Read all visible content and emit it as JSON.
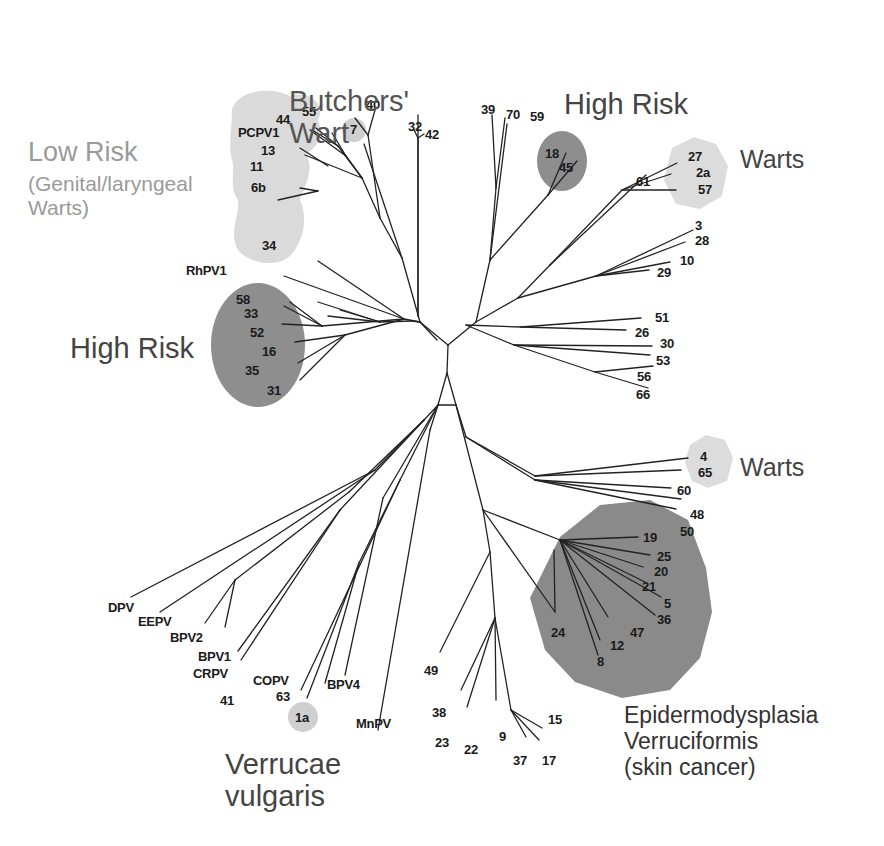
{
  "figure": {
    "type": "unrooted phylogenetic tree",
    "colors": {
      "background": "#ffffff",
      "branch": "#222222",
      "leaf_text": "#1a1a1a",
      "high_risk_fill": "#8e8e8e",
      "epidermodysplasia_fill": "#8a8a8a",
      "low_risk_fill": "#d9d9d9",
      "warts_fill": "#dcdcdc",
      "low_risk_label": "#a3a3a3",
      "dark_label": "#333333"
    }
  },
  "groups": [
    {
      "id": "butchers-wart",
      "label": "Butchers'\nWart",
      "x": 289,
      "y": 85,
      "size": 29,
      "color": "#555555"
    },
    {
      "id": "low-risk",
      "label": "Low Risk",
      "x": 28,
      "y": 137,
      "size": 27,
      "color": "#9a9a9a"
    },
    {
      "id": "low-risk-sub",
      "label": "(Genital/laryngeal\nWarts)",
      "x": 28,
      "y": 172,
      "size": 21,
      "color": "#9a9a9a"
    },
    {
      "id": "high-risk-left",
      "label": "High Risk",
      "x": 70,
      "y": 332,
      "size": 29,
      "color": "#444444"
    },
    {
      "id": "high-risk-top",
      "label": "High Risk",
      "x": 564,
      "y": 88,
      "size": 29,
      "color": "#444444"
    },
    {
      "id": "warts-top",
      "label": "Warts",
      "x": 740,
      "y": 145,
      "size": 25,
      "color": "#444444"
    },
    {
      "id": "warts-mid",
      "label": "Warts",
      "x": 740,
      "y": 453,
      "size": 25,
      "color": "#444444"
    },
    {
      "id": "verrucae-vulgaris",
      "label": "Verrucae\nvulgaris",
      "x": 225,
      "y": 748,
      "size": 29,
      "color": "#444444"
    },
    {
      "id": "epidermodysplasia",
      "label": "Epidermodysplasia\nVerruciformis\n(skin cancer)",
      "x": 624,
      "y": 703,
      "size": 23,
      "color": "#333333"
    }
  ],
  "regions": [
    {
      "id": "low-risk-blob",
      "shape": "path",
      "fill": "#dadada",
      "d": "M232,110 C236,92 268,85 290,96 C310,90 326,104 318,120 C324,134 318,148 306,154 C316,172 302,190 300,200 C310,222 300,246 290,256 C276,268 250,264 238,250 C228,232 240,216 238,200 C228,186 236,170 232,160 C228,146 232,126 232,110 Z"
    },
    {
      "id": "butchers-dot",
      "shape": "circle",
      "fill": "#cfcfcf",
      "cx": 354,
      "cy": 130,
      "r": 12
    },
    {
      "id": "high-risk-left-ellipse",
      "shape": "ellipse",
      "fill": "#8e8e8e",
      "cx": 258,
      "cy": 345,
      "rx": 47,
      "ry": 62
    },
    {
      "id": "high-risk-top-ellipse",
      "shape": "ellipse",
      "fill": "#8e8e8e",
      "cx": 562,
      "cy": 161,
      "rx": 25,
      "ry": 30
    },
    {
      "id": "warts-top-hex",
      "shape": "polygon",
      "fill": "#dcdcdc",
      "points": "672,148 694,137 716,144 728,166 722,196 700,209 676,204 664,180"
    },
    {
      "id": "warts-mid-hex",
      "shape": "polygon",
      "fill": "#dcdcdc",
      "points": "690,445 706,435 725,440 733,458 727,481 708,488 692,481 685,462"
    },
    {
      "id": "ev-polygon",
      "shape": "polygon",
      "fill": "#8a8a8a",
      "points": "560,537 600,505 650,500 688,520 706,568 712,612 700,658 670,690 622,698 575,682 545,650 530,598"
    },
    {
      "id": "verrucae-dot",
      "shape": "circle",
      "fill": "#cfcfcf",
      "cx": 303,
      "cy": 717,
      "r": 15
    }
  ],
  "branches": [
    [
      447,
      373,
      448,
      345
    ],
    [
      448,
      345,
      420,
      322
    ],
    [
      448,
      345,
      476,
      322
    ],
    [
      447,
      373,
      438,
      405
    ],
    [
      438,
      405,
      456,
      405
    ],
    [
      447,
      373,
      456,
      405
    ],
    [
      420,
      322,
      404,
      319
    ],
    [
      420,
      322,
      402,
      258
    ],
    [
      420,
      322,
      412,
      321
    ],
    [
      404,
      319,
      318,
      261
    ],
    [
      404,
      319,
      284,
      276
    ],
    [
      402,
      258,
      364,
      144
    ],
    [
      402,
      258,
      380,
      218
    ],
    [
      380,
      218,
      368,
      135
    ],
    [
      368,
      135,
      355,
      118
    ],
    [
      368,
      135,
      375,
      110
    ],
    [
      380,
      218,
      362,
      178
    ],
    [
      362,
      178,
      338,
      146
    ],
    [
      362,
      178,
      346,
      156
    ],
    [
      346,
      156,
      310,
      130
    ],
    [
      346,
      156,
      332,
      133
    ],
    [
      338,
      146,
      316,
      128
    ],
    [
      338,
      146,
      312,
      130
    ],
    [
      362,
      178,
      305,
      155
    ],
    [
      328,
      166,
      300,
      148
    ],
    [
      318,
      191,
      278,
      200
    ],
    [
      318,
      191,
      300,
      188
    ],
    [
      412,
      321,
      380,
      322
    ],
    [
      380,
      322,
      340,
      310
    ],
    [
      380,
      322,
      318,
      302
    ],
    [
      380,
      322,
      328,
      316
    ],
    [
      404,
      319,
      322,
      326
    ],
    [
      322,
      326,
      290,
      302
    ],
    [
      322,
      326,
      284,
      306
    ],
    [
      322,
      326,
      282,
      324
    ],
    [
      404,
      319,
      345,
      335
    ],
    [
      345,
      335,
      295,
      342
    ],
    [
      345,
      335,
      298,
      363
    ],
    [
      345,
      335,
      300,
      380
    ],
    [
      418,
      316,
      418,
      115
    ],
    [
      418,
      316,
      418,
      138
    ],
    [
      418,
      138,
      414,
      130
    ],
    [
      418,
      138,
      424,
      134
    ],
    [
      420,
      322,
      437,
      340
    ],
    [
      476,
      322,
      490,
      260
    ],
    [
      490,
      260,
      496,
      188
    ],
    [
      496,
      188,
      492,
      115
    ],
    [
      496,
      188,
      505,
      118
    ],
    [
      490,
      260,
      507,
      124
    ],
    [
      490,
      260,
      548,
      195
    ],
    [
      548,
      195,
      566,
      153
    ],
    [
      548,
      195,
      577,
      161
    ],
    [
      476,
      322,
      518,
      298
    ],
    [
      518,
      298,
      550,
      265
    ],
    [
      550,
      265,
      646,
      175
    ],
    [
      550,
      265,
      622,
      190
    ],
    [
      622,
      190,
      677,
      163
    ],
    [
      622,
      190,
      671,
      174
    ],
    [
      622,
      190,
      676,
      190
    ],
    [
      518,
      298,
      596,
      276
    ],
    [
      596,
      276,
      693,
      230
    ],
    [
      596,
      276,
      685,
      242
    ],
    [
      596,
      276,
      670,
      262
    ],
    [
      596,
      276,
      649,
      270
    ],
    [
      466,
      325,
      521,
      327
    ],
    [
      521,
      327,
      641,
      318
    ],
    [
      521,
      327,
      626,
      330
    ],
    [
      466,
      325,
      514,
      345
    ],
    [
      514,
      345,
      652,
      346
    ],
    [
      514,
      345,
      650,
      355
    ],
    [
      514,
      345,
      595,
      372
    ],
    [
      595,
      372,
      653,
      366
    ],
    [
      595,
      372,
      648,
      388
    ],
    [
      456,
      405,
      466,
      437
    ],
    [
      466,
      437,
      535,
      476
    ],
    [
      535,
      476,
      688,
      458
    ],
    [
      535,
      476,
      681,
      470
    ],
    [
      466,
      437,
      535,
      480
    ],
    [
      535,
      480,
      671,
      488
    ],
    [
      535,
      480,
      681,
      499
    ],
    [
      535,
      480,
      676,
      509
    ],
    [
      456,
      405,
      483,
      510
    ],
    [
      483,
      510,
      560,
      540
    ],
    [
      560,
      540,
      638,
      537
    ],
    [
      560,
      540,
      650,
      555
    ],
    [
      560,
      540,
      643,
      567
    ],
    [
      560,
      540,
      645,
      582
    ],
    [
      560,
      540,
      661,
      597
    ],
    [
      560,
      540,
      655,
      615
    ],
    [
      483,
      510,
      555,
      612
    ],
    [
      555,
      612,
      554,
      550
    ],
    [
      560,
      540,
      608,
      617
    ],
    [
      560,
      540,
      600,
      640
    ],
    [
      560,
      540,
      598,
      655
    ],
    [
      483,
      510,
      490,
      552
    ],
    [
      490,
      552,
      440,
      652
    ],
    [
      490,
      552,
      495,
      618
    ],
    [
      495,
      618,
      461,
      690
    ],
    [
      495,
      618,
      467,
      707
    ],
    [
      495,
      618,
      496,
      700
    ],
    [
      495,
      618,
      511,
      710
    ],
    [
      511,
      710,
      526,
      737
    ],
    [
      511,
      710,
      542,
      728
    ],
    [
      511,
      710,
      539,
      740
    ],
    [
      438,
      405,
      424,
      420
    ],
    [
      424,
      420,
      375,
      470
    ],
    [
      375,
      470,
      131,
      597
    ],
    [
      375,
      470,
      160,
      612
    ],
    [
      424,
      420,
      349,
      492
    ],
    [
      349,
      492,
      235,
      580
    ],
    [
      235,
      580,
      205,
      623
    ],
    [
      235,
      580,
      225,
      627
    ],
    [
      424,
      420,
      340,
      510
    ],
    [
      340,
      510,
      238,
      651
    ],
    [
      340,
      510,
      241,
      660
    ],
    [
      438,
      405,
      400,
      480
    ],
    [
      400,
      480,
      301,
      690
    ],
    [
      400,
      480,
      359,
      563
    ],
    [
      359,
      563,
      325,
      683
    ],
    [
      359,
      563,
      307,
      698
    ],
    [
      438,
      405,
      383,
      498
    ],
    [
      383,
      498,
      345,
      675
    ],
    [
      438,
      405,
      430,
      430
    ],
    [
      430,
      430,
      378,
      730
    ]
  ],
  "leaves": [
    {
      "label": "40",
      "x": 366,
      "y": 98
    },
    {
      "label": "7",
      "x": 350,
      "y": 123
    },
    {
      "label": "32",
      "x": 408,
      "y": 120
    },
    {
      "label": "42",
      "x": 425,
      "y": 128
    },
    {
      "label": "44",
      "x": 276,
      "y": 113
    },
    {
      "label": "55",
      "x": 302,
      "y": 105
    },
    {
      "label": "PCPV1",
      "x": 238,
      "y": 126
    },
    {
      "label": "13",
      "x": 261,
      "y": 144
    },
    {
      "label": "11",
      "x": 250,
      "y": 160
    },
    {
      "label": "6b",
      "x": 251,
      "y": 181
    },
    {
      "label": "34",
      "x": 262,
      "y": 239
    },
    {
      "label": "RhPV1",
      "x": 186,
      "y": 264
    },
    {
      "label": "58",
      "x": 236,
      "y": 293
    },
    {
      "label": "33",
      "x": 244,
      "y": 307
    },
    {
      "label": "52",
      "x": 250,
      "y": 326
    },
    {
      "label": "16",
      "x": 262,
      "y": 345
    },
    {
      "label": "35",
      "x": 245,
      "y": 364
    },
    {
      "label": "31",
      "x": 267,
      "y": 384
    },
    {
      "label": "39",
      "x": 481,
      "y": 103
    },
    {
      "label": "70",
      "x": 506,
      "y": 108
    },
    {
      "label": "59",
      "x": 530,
      "y": 110
    },
    {
      "label": "18",
      "x": 545,
      "y": 147
    },
    {
      "label": "45",
      "x": 559,
      "y": 161
    },
    {
      "label": "61",
      "x": 636,
      "y": 175
    },
    {
      "label": "27",
      "x": 688,
      "y": 150
    },
    {
      "label": "2a",
      "x": 696,
      "y": 166
    },
    {
      "label": "57",
      "x": 698,
      "y": 183
    },
    {
      "label": "3",
      "x": 695,
      "y": 219
    },
    {
      "label": "28",
      "x": 695,
      "y": 234
    },
    {
      "label": "10",
      "x": 680,
      "y": 254
    },
    {
      "label": "29",
      "x": 657,
      "y": 266
    },
    {
      "label": "51",
      "x": 655,
      "y": 311
    },
    {
      "label": "26",
      "x": 635,
      "y": 326
    },
    {
      "label": "30",
      "x": 660,
      "y": 337
    },
    {
      "label": "53",
      "x": 656,
      "y": 354
    },
    {
      "label": "56",
      "x": 637,
      "y": 370
    },
    {
      "label": "66",
      "x": 636,
      "y": 388
    },
    {
      "label": "4",
      "x": 700,
      "y": 450
    },
    {
      "label": "65",
      "x": 698,
      "y": 466
    },
    {
      "label": "60",
      "x": 677,
      "y": 484
    },
    {
      "label": "48",
      "x": 690,
      "y": 508
    },
    {
      "label": "50",
      "x": 680,
      "y": 525
    },
    {
      "label": "19",
      "x": 643,
      "y": 531
    },
    {
      "label": "25",
      "x": 657,
      "y": 550
    },
    {
      "label": "20",
      "x": 654,
      "y": 565
    },
    {
      "label": "21",
      "x": 642,
      "y": 580
    },
    {
      "label": "5",
      "x": 664,
      "y": 597
    },
    {
      "label": "36",
      "x": 657,
      "y": 613
    },
    {
      "label": "47",
      "x": 630,
      "y": 626
    },
    {
      "label": "12",
      "x": 610,
      "y": 639
    },
    {
      "label": "8",
      "x": 597,
      "y": 655
    },
    {
      "label": "24",
      "x": 551,
      "y": 626
    },
    {
      "label": "49",
      "x": 424,
      "y": 664
    },
    {
      "label": "38",
      "x": 432,
      "y": 706
    },
    {
      "label": "23",
      "x": 435,
      "y": 736
    },
    {
      "label": "22",
      "x": 464,
      "y": 743
    },
    {
      "label": "9",
      "x": 499,
      "y": 730
    },
    {
      "label": "37",
      "x": 513,
      "y": 754
    },
    {
      "label": "17",
      "x": 542,
      "y": 754
    },
    {
      "label": "15",
      "x": 548,
      "y": 713
    },
    {
      "label": "DPV",
      "x": 108,
      "y": 601
    },
    {
      "label": "EEPV",
      "x": 138,
      "y": 615
    },
    {
      "label": "BPV2",
      "x": 170,
      "y": 631
    },
    {
      "label": "BPV1",
      "x": 198,
      "y": 650
    },
    {
      "label": "CRPV",
      "x": 193,
      "y": 667
    },
    {
      "label": "41",
      "x": 220,
      "y": 694
    },
    {
      "label": "COPV",
      "x": 253,
      "y": 674
    },
    {
      "label": "63",
      "x": 276,
      "y": 690
    },
    {
      "label": "1a",
      "x": 295,
      "y": 711
    },
    {
      "label": "BPV4",
      "x": 327,
      "y": 678
    },
    {
      "label": "MnPV",
      "x": 356,
      "y": 717
    }
  ]
}
